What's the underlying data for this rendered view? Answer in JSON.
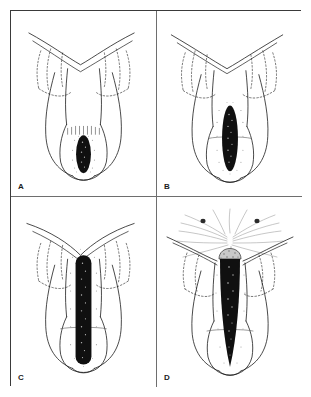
{
  "figure": {
    "type": "medical-line-illustration",
    "panel_count": 4,
    "layout": "2x2 grid",
    "frame_color": "#3a3a3a",
    "divider_color": "#6e6e6e",
    "background_color": "#ffffff",
    "ink_color": "#1c1c1c",
    "lesion_fill_color": "#101010",
    "stipple_color": "#8a8a8a",
    "panels": [
      {
        "id": "panel-a",
        "label": "A",
        "position": "top-left",
        "lesion_shape": "small-oval",
        "lesion_extent": "confined to lower chamber",
        "features": "small dark oval at base with stippled halo and hatched margin above"
      },
      {
        "id": "panel-b",
        "label": "B",
        "position": "top-right",
        "lesion_shape": "elongated-ellipse",
        "lesion_extent": "extends upward through mid chamber",
        "features": "elongated dark ellipse with stippled halo"
      },
      {
        "id": "panel-c",
        "label": "C",
        "position": "bottom-left",
        "lesion_shape": "long-channel",
        "lesion_extent": "spans full height of chamber to upper neck",
        "features": "long dark channel with rounded ends and mottled interior"
      },
      {
        "id": "panel-d",
        "label": "D",
        "position": "bottom-right",
        "lesion_shape": "perforating-channel",
        "lesion_extent": "breaches apex into surrounding tissue",
        "features": "tapering channel with stippled dome cap, radiating strokes and two dark spots above"
      }
    ]
  }
}
